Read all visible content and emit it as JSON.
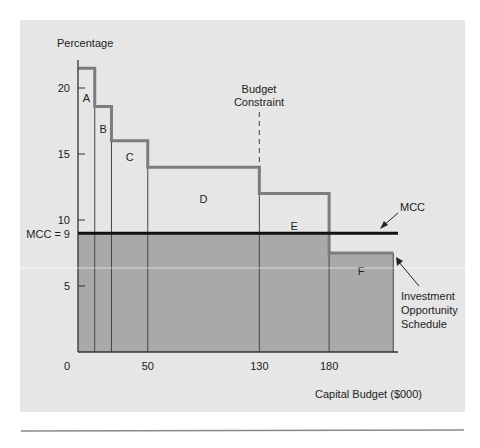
{
  "colors": {
    "page_background": "#ffffff",
    "panel_background": "#e6e6e6",
    "below_mcc_fill": "#a9a9a9",
    "step_outline": "#7d7d7d",
    "mcc_line": "#111111",
    "axis": "#333333",
    "footer_rule": "#8a8a8a"
  },
  "chart_data": {
    "type": "bar",
    "subtype": "step (investment opportunity schedule vs marginal cost of capital)",
    "title": "",
    "ylabel": "Percentage",
    "xlabel": "Capital Budget ($000)",
    "ylim": [
      0,
      22
    ],
    "xlim": [
      0,
      230
    ],
    "yticks": [
      5,
      10,
      15,
      20
    ],
    "ytick_labels": [
      "5",
      "10",
      "15",
      "20"
    ],
    "xticks": [
      0,
      50,
      130,
      180
    ],
    "xtick_labels": [
      "0",
      "50",
      "130",
      "180"
    ],
    "grid": false,
    "projects": [
      {
        "label": "A",
        "x_start": 0,
        "x_end": 12,
        "return": 21.5
      },
      {
        "label": "B",
        "x_start": 12,
        "x_end": 24,
        "return": 18.6
      },
      {
        "label": "C",
        "x_start": 24,
        "x_end": 50,
        "return": 16
      },
      {
        "label": "D",
        "x_start": 50,
        "x_end": 130,
        "return": 14
      },
      {
        "label": "E",
        "x_start": 130,
        "x_end": 180,
        "return": 12
      },
      {
        "label": "F",
        "x_start": 180,
        "x_end": 226,
        "return": 7.5
      }
    ],
    "mcc": {
      "value": 9,
      "label": "MCC = 9",
      "line_label": "MCC"
    },
    "budget_constraint": {
      "x": 130,
      "label_line1": "Budget",
      "label_line2": "Constraint"
    },
    "annotations": [
      {
        "text": "MCC",
        "points_to": "MCC line"
      },
      {
        "text": "Investment Opportunity Schedule",
        "lines": [
          "Investment",
          "Opportunity",
          "Schedule"
        ],
        "points_to": "project F step"
      }
    ]
  },
  "labels": {
    "y_axis_title": "Percentage",
    "x_axis_title": "Capital Budget ($000)",
    "mcc_axis_label": "MCC = 9",
    "mcc_callout": "MCC",
    "budget_line1": "Budget",
    "budget_line2": "Constraint",
    "ios_line1": "Investment",
    "ios_line2": "Opportunity",
    "ios_line3": "Schedule"
  }
}
